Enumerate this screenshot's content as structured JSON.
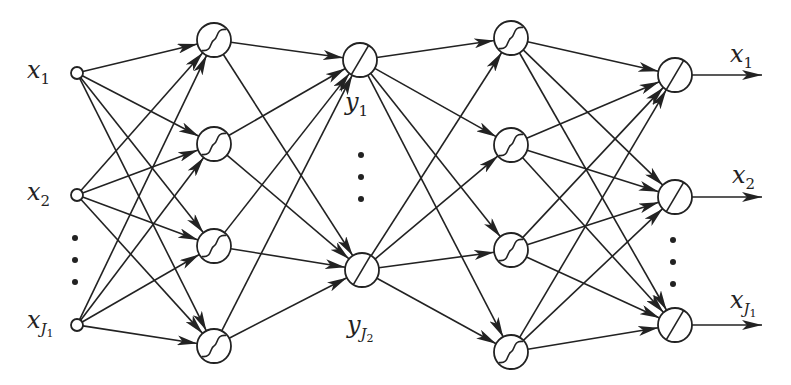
{
  "diagram": {
    "type": "autoencoder-neural-network",
    "colors": {
      "stroke": "#222222",
      "background": "#ffffff"
    },
    "layers": [
      {
        "name": "input",
        "node_type": "small-circle",
        "nodes": [
          {
            "x": 77,
            "y": 73
          },
          {
            "x": 77,
            "y": 195
          },
          {
            "x": 77,
            "y": 325
          }
        ],
        "r": 6
      },
      {
        "name": "hidden-1",
        "node_type": "sigmoid",
        "nodes": [
          {
            "x": 214,
            "y": 40
          },
          {
            "x": 214,
            "y": 144
          },
          {
            "x": 214,
            "y": 246
          },
          {
            "x": 214,
            "y": 346
          }
        ],
        "r": 17
      },
      {
        "name": "bottleneck",
        "node_type": "linear",
        "nodes": [
          {
            "x": 360,
            "y": 60
          },
          {
            "x": 362,
            "y": 270
          }
        ],
        "r": 17
      },
      {
        "name": "hidden-3",
        "node_type": "sigmoid",
        "nodes": [
          {
            "x": 511,
            "y": 38
          },
          {
            "x": 511,
            "y": 145
          },
          {
            "x": 511,
            "y": 250
          },
          {
            "x": 511,
            "y": 352
          }
        ],
        "r": 17
      },
      {
        "name": "output",
        "node_type": "linear",
        "nodes": [
          {
            "x": 675,
            "y": 75
          },
          {
            "x": 675,
            "y": 197
          },
          {
            "x": 675,
            "y": 325
          }
        ],
        "r": 17
      }
    ],
    "output_arrow_end_x": 762,
    "ellipsis_dots": [
      {
        "x": 75,
        "ys": [
          238,
          260,
          282
        ]
      },
      {
        "x": 361,
        "ys": [
          155,
          177,
          199
        ]
      },
      {
        "x": 673,
        "ys": [
          240,
          262,
          284
        ]
      }
    ],
    "labels": {
      "in_x1": {
        "base": "x",
        "sub": "1"
      },
      "in_x2": {
        "base": "x",
        "sub": "2"
      },
      "in_xJ1": {
        "base": "x",
        "sub": "J",
        "subsub": "1"
      },
      "y1": {
        "base": "y",
        "sub": "1"
      },
      "yJ2": {
        "base": "y",
        "sub": "J",
        "subsub": "2"
      },
      "out_x1": {
        "base": "x",
        "sub": "1"
      },
      "out_x2": {
        "base": "x",
        "sub": "2"
      },
      "out_xJ1": {
        "base": "x",
        "sub": "J",
        "subsub": "1"
      }
    }
  }
}
